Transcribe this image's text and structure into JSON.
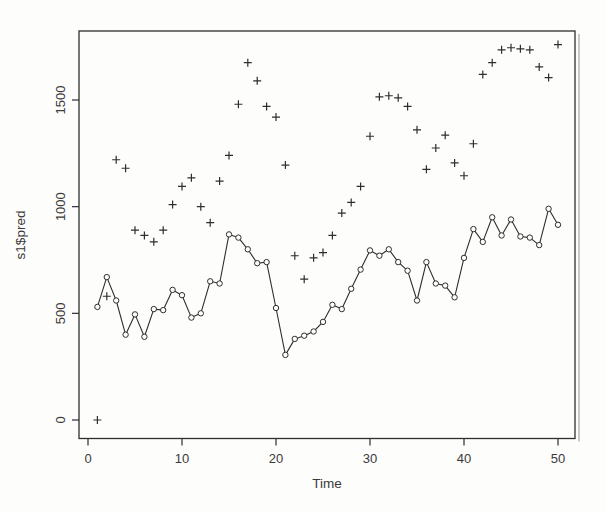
{
  "figure": {
    "kind": "R base graphics scatter/line plot (scanned print style)"
  },
  "colors": {
    "background": "#fdfdfc",
    "stroke": "#2e2e2e",
    "text": "#3a3a3a",
    "scan_shadow": "#c9c9c5"
  },
  "chart_data": {
    "type": "line",
    "title": "",
    "xlabel": "Time",
    "ylabel": "s1$pred",
    "xlim": [
      0,
      52
    ],
    "ylim": [
      -85,
      1820
    ],
    "x_ticks": [
      0,
      10,
      20,
      30,
      40,
      50
    ],
    "y_ticks": [
      0,
      500,
      1000,
      1500
    ],
    "grid": false,
    "legend": "none",
    "x": [
      1,
      2,
      3,
      4,
      5,
      6,
      7,
      8,
      9,
      10,
      11,
      12,
      13,
      14,
      15,
      16,
      17,
      18,
      19,
      20,
      21,
      22,
      23,
      24,
      25,
      26,
      27,
      28,
      29,
      30,
      31,
      32,
      33,
      34,
      35,
      36,
      37,
      38,
      39,
      40,
      41,
      42,
      43,
      44,
      45,
      46,
      47,
      48,
      49,
      50
    ],
    "series": [
      {
        "name": "s1$pred fitted line",
        "marker": "circle",
        "connected": true,
        "values": [
          530,
          670,
          560,
          400,
          495,
          390,
          520,
          515,
          610,
          585,
          480,
          500,
          650,
          640,
          870,
          855,
          800,
          735,
          740,
          525,
          305,
          380,
          395,
          415,
          460,
          540,
          520,
          615,
          705,
          795,
          770,
          800,
          740,
          700,
          560,
          740,
          640,
          630,
          575,
          760,
          895,
          835,
          950,
          865,
          940,
          860,
          855,
          820,
          990,
          915
        ]
      },
      {
        "name": "observed points",
        "marker": "plus",
        "connected": false,
        "values": [
          0,
          580,
          1220,
          1180,
          890,
          865,
          835,
          890,
          1010,
          1095,
          1135,
          1000,
          925,
          1120,
          1240,
          1480,
          1675,
          1590,
          1470,
          1420,
          1195,
          770,
          660,
          760,
          785,
          865,
          970,
          1020,
          1095,
          1330,
          1515,
          1520,
          1510,
          1470,
          1360,
          1175,
          1275,
          1335,
          1205,
          1145,
          1295,
          1620,
          1675,
          1735,
          1745,
          1740,
          1735,
          1655,
          1605,
          1760
        ]
      }
    ]
  }
}
